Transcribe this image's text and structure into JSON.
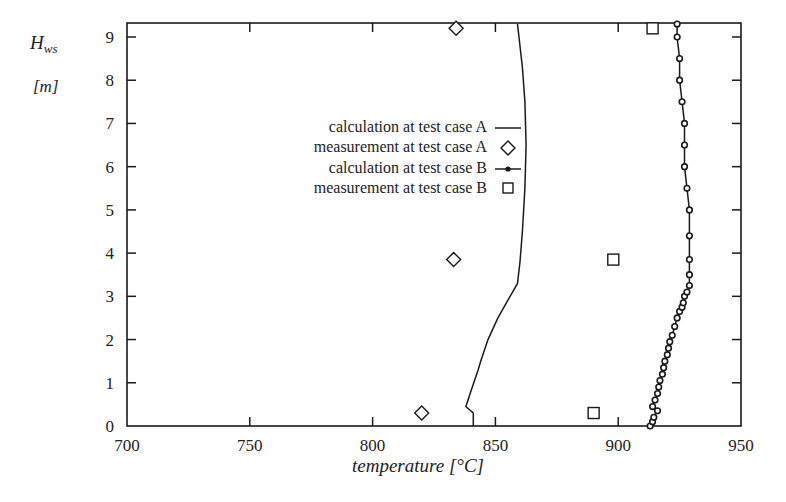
{
  "chart_data": {
    "type": "line",
    "title": "",
    "xlabel": "temperature [°C]",
    "ylabel_symbol": "H",
    "ylabel_subscript": "ws",
    "ylabel_unit": "[m]",
    "xlim": [
      700,
      950
    ],
    "ylim": [
      0,
      9.3
    ],
    "xticks": [
      700,
      750,
      800,
      850,
      900,
      950
    ],
    "yticks": [
      0,
      1,
      2,
      3,
      4,
      5,
      6,
      7,
      8,
      9
    ],
    "grid": false,
    "legend_position": "upper-left-inside",
    "series": [
      {
        "name": "calculation at test case A",
        "style": "line",
        "points": [
          [
            841,
            0.0
          ],
          [
            841,
            0.3
          ],
          [
            838,
            0.45
          ],
          [
            840,
            0.8
          ],
          [
            843,
            1.3
          ],
          [
            844,
            1.5
          ],
          [
            847,
            2.0
          ],
          [
            851,
            2.5
          ],
          [
            856,
            3.0
          ],
          [
            859,
            3.3
          ],
          [
            860,
            3.8
          ],
          [
            861,
            4.5
          ],
          [
            862,
            5.5
          ],
          [
            862.5,
            6.5
          ],
          [
            862,
            7.5
          ],
          [
            861,
            8.3
          ],
          [
            859,
            9.3
          ]
        ]
      },
      {
        "name": "measurement at test case A",
        "style": "diamond",
        "points": [
          [
            820,
            0.3
          ],
          [
            833,
            3.85
          ],
          [
            834,
            9.2
          ]
        ]
      },
      {
        "name": "calculation at test case B",
        "style": "line-with-circles",
        "points": [
          [
            913,
            0.0
          ],
          [
            914,
            0.1
          ],
          [
            914.5,
            0.2
          ],
          [
            916,
            0.35
          ],
          [
            914,
            0.45
          ],
          [
            915,
            0.6
          ],
          [
            916,
            0.75
          ],
          [
            916.5,
            0.9
          ],
          [
            917,
            1.05
          ],
          [
            918,
            1.2
          ],
          [
            918.5,
            1.35
          ],
          [
            919,
            1.5
          ],
          [
            920,
            1.65
          ],
          [
            920.5,
            1.8
          ],
          [
            921,
            1.95
          ],
          [
            922,
            2.1
          ],
          [
            923,
            2.3
          ],
          [
            924,
            2.5
          ],
          [
            925,
            2.65
          ],
          [
            926,
            2.75
          ],
          [
            926.5,
            2.85
          ],
          [
            927,
            3.0
          ],
          [
            928,
            3.1
          ],
          [
            929,
            3.25
          ],
          [
            929,
            3.5
          ],
          [
            929,
            3.85
          ],
          [
            929,
            4.4
          ],
          [
            929,
            5.0
          ],
          [
            928,
            5.5
          ],
          [
            927,
            6.0
          ],
          [
            927,
            6.5
          ],
          [
            927,
            7.0
          ],
          [
            926,
            7.5
          ],
          [
            925,
            8.0
          ],
          [
            925,
            8.5
          ],
          [
            924,
            9.0
          ],
          [
            924,
            9.3
          ]
        ]
      },
      {
        "name": "measurement at test case B",
        "style": "square",
        "points": [
          [
            890,
            0.3
          ],
          [
            898,
            3.85
          ],
          [
            914,
            9.2
          ]
        ]
      }
    ]
  },
  "legend": {
    "items": [
      {
        "label": "calculation at test case A"
      },
      {
        "label": "measurement at test case A"
      },
      {
        "label": "calculation at test case B"
      },
      {
        "label": "measurement at test case B"
      }
    ]
  }
}
